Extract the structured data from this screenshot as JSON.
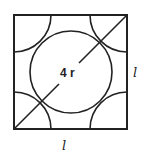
{
  "diagram": {
    "type": "geometry",
    "labels": {
      "diagonal": "4 r",
      "side_right": "l",
      "side_bottom": "l"
    },
    "colors": {
      "stroke": "#222222",
      "background": "#ffffff"
    },
    "shapes": {
      "square": {
        "x": 14,
        "y": 15,
        "width": 113,
        "height": 114
      },
      "center_circle": {
        "cx": 71,
        "cy": 72,
        "r": 41
      },
      "corner_arc_radius": 37,
      "diagonal": {
        "x1": 14,
        "y1": 129,
        "x2": 127,
        "y2": 15
      }
    }
  }
}
